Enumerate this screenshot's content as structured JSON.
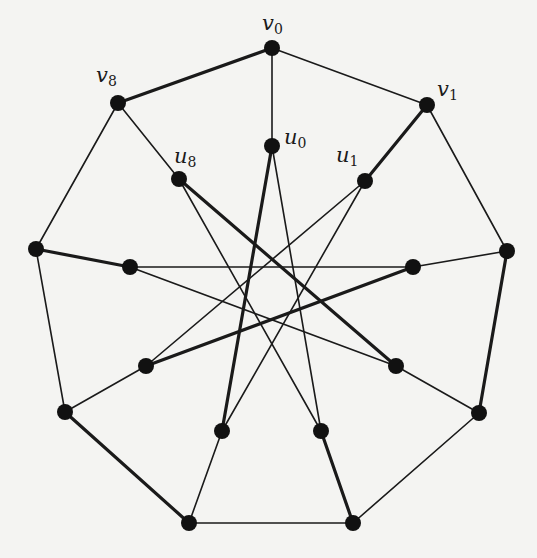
{
  "diagram": {
    "type": "graph",
    "colors": {
      "background": "#f4f4f2",
      "edge": "#1a1a1a",
      "node": "#111111"
    },
    "node_radius": 8,
    "nodes": [
      {
        "id": "v0",
        "x": 272,
        "y": 48,
        "label": "v",
        "sub": "0",
        "lx": 262,
        "ly": 30
      },
      {
        "id": "v1",
        "x": 427,
        "y": 105,
        "label": "v",
        "sub": "1",
        "lx": 437,
        "ly": 96
      },
      {
        "id": "v2",
        "x": 507,
        "y": 251
      },
      {
        "id": "v3",
        "x": 479,
        "y": 413
      },
      {
        "id": "v4",
        "x": 353,
        "y": 523
      },
      {
        "id": "v5",
        "x": 189,
        "y": 523
      },
      {
        "id": "v6",
        "x": 65,
        "y": 412
      },
      {
        "id": "v7",
        "x": 36,
        "y": 249
      },
      {
        "id": "v8",
        "x": 118,
        "y": 103,
        "label": "v",
        "sub": "8",
        "lx": 96,
        "ly": 82
      },
      {
        "id": "u0",
        "x": 272,
        "y": 146,
        "label": "u",
        "sub": "0",
        "lx": 284,
        "ly": 144
      },
      {
        "id": "u1",
        "x": 365,
        "y": 181,
        "label": "u",
        "sub": "1",
        "lx": 336,
        "ly": 162
      },
      {
        "id": "u2",
        "x": 413,
        "y": 267
      },
      {
        "id": "u3",
        "x": 396,
        "y": 366
      },
      {
        "id": "u4",
        "x": 321,
        "y": 431
      },
      {
        "id": "u5",
        "x": 222,
        "y": 431
      },
      {
        "id": "u6",
        "x": 146,
        "y": 366
      },
      {
        "id": "u7",
        "x": 130,
        "y": 267
      },
      {
        "id": "u8",
        "x": 179,
        "y": 179,
        "label": "u",
        "sub": "8",
        "lx": 174,
        "ly": 163
      }
    ],
    "edges": [
      {
        "from": "v0",
        "to": "v1",
        "weight": "thin"
      },
      {
        "from": "v1",
        "to": "v2",
        "weight": "thin"
      },
      {
        "from": "v2",
        "to": "v3",
        "weight": "thick"
      },
      {
        "from": "v3",
        "to": "v4",
        "weight": "thin"
      },
      {
        "from": "v4",
        "to": "v5",
        "weight": "thin"
      },
      {
        "from": "v5",
        "to": "v6",
        "weight": "thick"
      },
      {
        "from": "v6",
        "to": "v7",
        "weight": "thin"
      },
      {
        "from": "v7",
        "to": "v8",
        "weight": "thin"
      },
      {
        "from": "v8",
        "to": "v0",
        "weight": "thick"
      },
      {
        "from": "v0",
        "to": "u0",
        "weight": "thin"
      },
      {
        "from": "v1",
        "to": "u1",
        "weight": "thick"
      },
      {
        "from": "v2",
        "to": "u2",
        "weight": "thin"
      },
      {
        "from": "v3",
        "to": "u3",
        "weight": "thin"
      },
      {
        "from": "v4",
        "to": "u4",
        "weight": "thick"
      },
      {
        "from": "v5",
        "to": "u5",
        "weight": "thin"
      },
      {
        "from": "v6",
        "to": "u6",
        "weight": "thin"
      },
      {
        "from": "v7",
        "to": "u7",
        "weight": "thick"
      },
      {
        "from": "v8",
        "to": "u8",
        "weight": "thin"
      },
      {
        "from": "u0",
        "to": "u4",
        "weight": "thin"
      },
      {
        "from": "u0",
        "to": "u5",
        "weight": "thick"
      },
      {
        "from": "u1",
        "to": "u5",
        "weight": "thin"
      },
      {
        "from": "u1",
        "to": "u6",
        "weight": "thin"
      },
      {
        "from": "u2",
        "to": "u6",
        "weight": "thick"
      },
      {
        "from": "u2",
        "to": "u7",
        "weight": "thin"
      },
      {
        "from": "u3",
        "to": "u7",
        "weight": "thin"
      },
      {
        "from": "u3",
        "to": "u8",
        "weight": "thick"
      },
      {
        "from": "u4",
        "to": "u8",
        "weight": "thin"
      }
    ]
  }
}
